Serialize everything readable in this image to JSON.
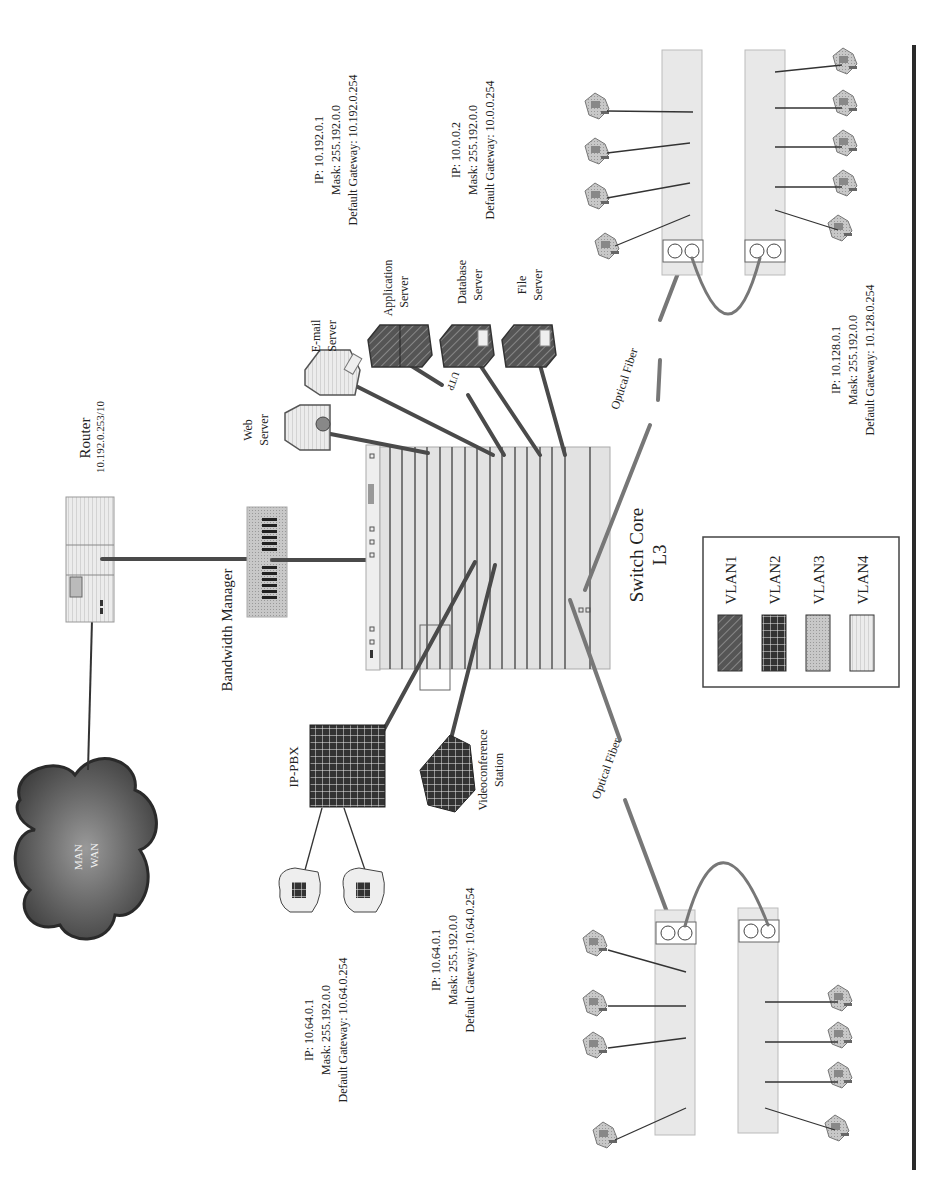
{
  "diagram": {
    "orientation": "rotated -90deg (text reads bottom-to-top)",
    "cloud": {
      "line1": "MAN",
      "line2": "WAN"
    },
    "router": {
      "title": "Router",
      "ip": "10.192.0.253/10"
    },
    "bandwidth_manager": {
      "label": "Bandwidth Manager"
    },
    "switch_core": {
      "line1": "Switch Core",
      "line2": "L3"
    },
    "servers": [
      {
        "line1": "Web",
        "line2": "Server",
        "vlan": "VLAN4"
      },
      {
        "line1": "E-mail",
        "line2": "Server",
        "vlan": "VLAN4"
      },
      {
        "line1": "Application",
        "line2": "Server",
        "vlan": "VLAN1"
      },
      {
        "line1": "Database",
        "line2": "Server",
        "vlan": "VLAN1"
      },
      {
        "line1": "File",
        "line2": "Server",
        "vlan": "VLAN1"
      }
    ],
    "utp_label": "UTP",
    "server_ip_blocks": [
      {
        "ip": "IP: 10.192.0.1",
        "mask": "Mask: 255.192.0.0",
        "gateway": "Default Gateway: 10.192.0.254"
      },
      {
        "ip": "IP: 10.0.0.2",
        "mask": "Mask: 255.192.0.0",
        "gateway": "Default Gateway: 10.0.0.254"
      }
    ],
    "ip_pbx": {
      "label": "IP-PBX"
    },
    "videoconference": {
      "line1": "Videoconference",
      "line2": "Station"
    },
    "phone_ip_block": {
      "ip": "IP: 10.64.0.1",
      "mask": "Mask: 255.192.0.0",
      "gateway": "Default Gateway: 10.64.0.254"
    },
    "video_ip_block": {
      "ip": "IP: 10.64.0.1",
      "mask": "Mask: 255.192.0.0",
      "gateway": "Default Gateway: 10.64.0.254"
    },
    "right_ip_block": {
      "ip": "IP: 10.128.0.1",
      "mask": "Mask: 255.192.0.0",
      "gateway": "Default Gateway: 10.128.0.254"
    },
    "fiber_labels": {
      "upper": "Optical Fiber",
      "lower": "Optical Fiber"
    },
    "legend": [
      {
        "label": "VLAN1",
        "pattern": "diagonal-hatch-dark"
      },
      {
        "label": "VLAN2",
        "pattern": "grid-dark"
      },
      {
        "label": "VLAN3",
        "pattern": "stipple-gray"
      },
      {
        "label": "VLAN4",
        "pattern": "horizontal-lines-light"
      }
    ],
    "colors": {
      "cable": "#4a4a4a",
      "fiber": "#777777",
      "device_light": "#e6e6e6",
      "device_dark": "#4d4d4d",
      "border_bar": "#2a2a2a"
    }
  }
}
